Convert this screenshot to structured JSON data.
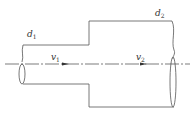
{
  "diagram": {
    "type": "pipe-expansion",
    "labels": {
      "d1": {
        "main": "d",
        "sub": "1"
      },
      "d2": {
        "main": "d",
        "sub": "2"
      },
      "v1": {
        "main": "v",
        "sub": "1"
      },
      "v2": {
        "main": "v",
        "sub": "2"
      }
    },
    "colors": {
      "stroke": "#555555",
      "centerline": "#444444",
      "background": "#ffffff"
    }
  }
}
